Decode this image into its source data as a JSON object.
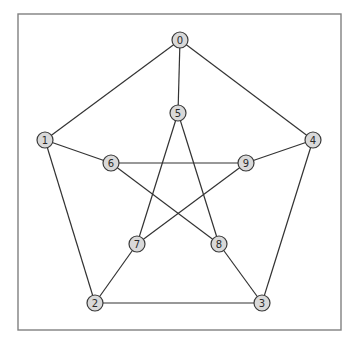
{
  "diagram": {
    "type": "graph",
    "name": "Petersen graph",
    "frame": {
      "x": 18,
      "y": 14,
      "width": 323,
      "height": 316,
      "stroke": "#808080"
    },
    "node_style": {
      "fill": "#d9d9d9",
      "stroke": "#3a3a3a",
      "radius": 8
    },
    "edge_color": "#333333",
    "nodes": [
      {
        "id": "0",
        "label": "0",
        "x": 180,
        "y": 40
      },
      {
        "id": "1",
        "label": "1",
        "x": 45,
        "y": 140
      },
      {
        "id": "2",
        "label": "2",
        "x": 95,
        "y": 303
      },
      {
        "id": "3",
        "label": "3",
        "x": 262,
        "y": 303
      },
      {
        "id": "4",
        "label": "4",
        "x": 313,
        "y": 140
      },
      {
        "id": "5",
        "label": "5",
        "x": 178,
        "y": 113
      },
      {
        "id": "6",
        "label": "6",
        "x": 111,
        "y": 163
      },
      {
        "id": "7",
        "label": "7",
        "x": 137,
        "y": 244
      },
      {
        "id": "8",
        "label": "8",
        "x": 219,
        "y": 244
      },
      {
        "id": "9",
        "label": "9",
        "x": 246,
        "y": 163
      }
    ],
    "edges": [
      [
        "0",
        "1"
      ],
      [
        "1",
        "2"
      ],
      [
        "2",
        "3"
      ],
      [
        "3",
        "4"
      ],
      [
        "4",
        "0"
      ],
      [
        "0",
        "5"
      ],
      [
        "1",
        "6"
      ],
      [
        "2",
        "7"
      ],
      [
        "3",
        "8"
      ],
      [
        "4",
        "9"
      ],
      [
        "5",
        "7"
      ],
      [
        "7",
        "9"
      ],
      [
        "9",
        "6"
      ],
      [
        "6",
        "8"
      ],
      [
        "8",
        "5"
      ]
    ]
  }
}
